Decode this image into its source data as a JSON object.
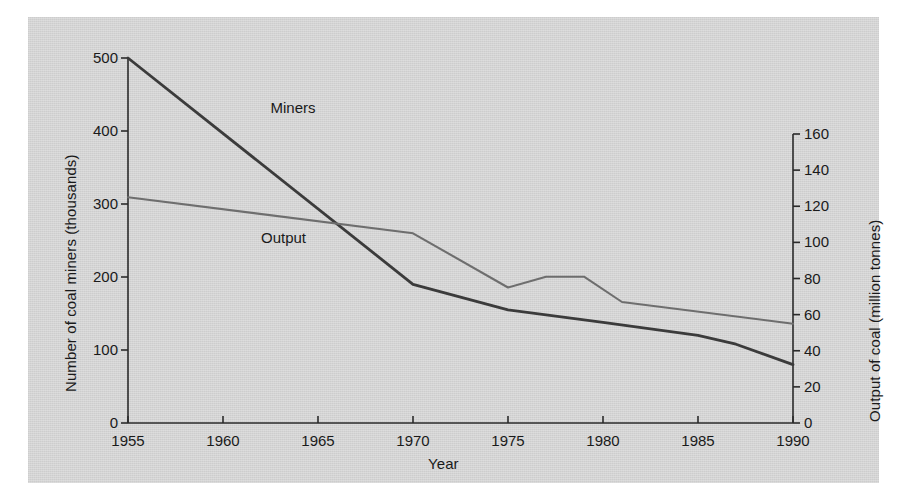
{
  "chart_data": {
    "type": "line",
    "title": "",
    "xlabel": "Year",
    "ylabel": "Number of coal miners (thousands)",
    "ylabel_right": "Output of coal (million tonnes)",
    "xlim": [
      1955,
      1990
    ],
    "ylim": [
      0,
      500
    ],
    "ylim_right": [
      0,
      160
    ],
    "grid": false,
    "legend": "inline-labels",
    "xticks": [
      1955,
      1960,
      1965,
      1970,
      1975,
      1980,
      1985,
      1990
    ],
    "yticks_left": [
      0,
      100,
      200,
      300,
      400,
      500
    ],
    "yticks_right": [
      0,
      20,
      40,
      60,
      80,
      100,
      120,
      140,
      160
    ],
    "series": [
      {
        "name": "Miners",
        "axis": "left",
        "units": "thousands",
        "color": "#3b3b3b",
        "label_position": {
          "x": 1962.5,
          "y": 430
        },
        "x": [
          1955,
          1970,
          1975,
          1980,
          1985,
          1987,
          1990
        ],
        "values": [
          500,
          190,
          155,
          138,
          120,
          108,
          80
        ]
      },
      {
        "name": "Output",
        "axis": "right",
        "units": "million tonnes",
        "color": "#6e6e6e",
        "label_position": {
          "x": 1962.0,
          "y": 102
        },
        "x": [
          1955,
          1970,
          1975,
          1977,
          1979,
          1981,
          1990
        ],
        "values": [
          125,
          105,
          75,
          81,
          81,
          67,
          55
        ]
      }
    ]
  },
  "axes": {
    "x_tick_labels": [
      "1955",
      "1960",
      "1965",
      "1970",
      "1975",
      "1980",
      "1985",
      "1990"
    ],
    "y_left_tick_labels": [
      "0",
      "100",
      "200",
      "300",
      "400",
      "500"
    ],
    "y_right_tick_labels": [
      "0",
      "20",
      "40",
      "60",
      "80",
      "100",
      "120",
      "140",
      "160"
    ],
    "x_axis_title": "Year",
    "y_left_axis_title": "Number of coal miners (thousands)",
    "y_right_axis_title": "Output of coal (million tonnes)"
  },
  "series_labels": {
    "miners": "Miners",
    "output": "Output"
  },
  "colors": {
    "panel_background": "#d4d4d4",
    "page_background": "#ffffff",
    "axis": "#2b2b2b",
    "miners_line": "#3b3b3b",
    "output_line": "#6e6e6e",
    "text": "#1a1a1a"
  }
}
